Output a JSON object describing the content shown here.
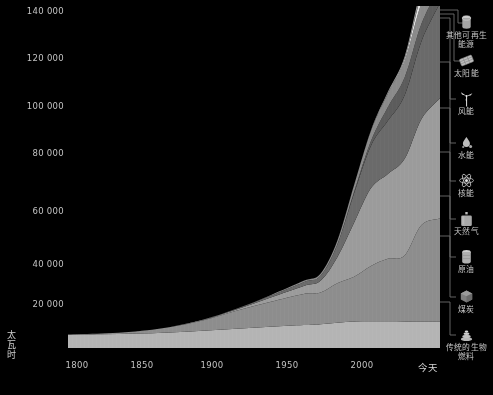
{
  "chart_data": {
    "type": "area",
    "title": "",
    "xlabel": "",
    "ylabel": "太瓦时",
    "ylim": [
      0,
      145000
    ],
    "xlim": [
      1800,
      2021
    ],
    "grid": false,
    "legend_position": "right",
    "ytick_labels": [
      "140 000",
      "120 000",
      "100 000",
      "80 000",
      "60 000",
      "40 000",
      "20 000"
    ],
    "ytick_values": [
      140000,
      120000,
      100000,
      80000,
      60000,
      40000,
      20000
    ],
    "xtick_labels": [
      "1800",
      "1850",
      "1900",
      "1950",
      "2000",
      "今天"
    ],
    "xtick_values": [
      1800,
      1850,
      1900,
      1950,
      2000,
      2021
    ],
    "x": [
      1800,
      1820,
      1840,
      1860,
      1880,
      1900,
      1920,
      1940,
      1950,
      1960,
      1970,
      1980,
      1990,
      2000,
      2010,
      2021
    ],
    "series": [
      {
        "name": "传统的生物燃料",
        "color": "#b4b4b4",
        "values": [
          5600,
          5800,
          6100,
          6600,
          7300,
          8200,
          9000,
          9700,
          10100,
          10700,
          11200,
          11300,
          11300,
          11200,
          11100,
          11100
        ]
      },
      {
        "name": "煤炭",
        "color": "#8d8d8d",
        "values": [
          100,
          300,
          900,
          2200,
          4400,
          7600,
          10500,
          13200,
          13400,
          16800,
          19000,
          23500,
          26500,
          28000,
          41000,
          43800
        ]
      },
      {
        "name": "原油",
        "color": "#9b9b9b",
        "values": [
          0,
          0,
          0,
          30,
          180,
          570,
          1800,
          3400,
          5000,
          11000,
          23000,
          33000,
          36000,
          41000,
          45000,
          51000
        ]
      },
      {
        "name": "天然气",
        "color": "#6a6a6a",
        "values": [
          0,
          0,
          0,
          0,
          40,
          180,
          700,
          1600,
          2100,
          5300,
          12500,
          18000,
          22500,
          27000,
          33000,
          40400
        ]
      },
      {
        "name": "核能",
        "color": "#5c5c5c",
        "values": [
          0,
          0,
          0,
          0,
          0,
          0,
          0,
          0,
          0,
          60,
          640,
          2000,
          5800,
          7500,
          7400,
          7030
        ]
      },
      {
        "name": "水能",
        "color": "#8a8a8a",
        "values": [
          0,
          0,
          0,
          0,
          10,
          60,
          300,
          600,
          900,
          1600,
          2800,
          4300,
          5700,
          7000,
          8800,
          10500
        ]
      },
      {
        "name": "风能",
        "color": "#e2e2e2",
        "values": [
          0,
          0,
          0,
          0,
          0,
          0,
          0,
          0,
          0,
          0,
          0,
          10,
          90,
          800,
          3500,
          4300
        ]
      },
      {
        "name": "太阳能",
        "color": "#d0d0d0",
        "values": [
          0,
          0,
          0,
          0,
          0,
          0,
          0,
          0,
          0,
          0,
          0,
          0,
          10,
          30,
          800,
          2900
        ]
      },
      {
        "name": "其他可再生能源",
        "color": "#9e9e9e",
        "values": [
          0,
          0,
          0,
          0,
          0,
          0,
          0,
          0,
          0,
          20,
          80,
          250,
          600,
          1100,
          2300,
          3100
        ]
      }
    ]
  },
  "axis": {
    "y_title_chars": [
      "太",
      "瓦",
      "时"
    ]
  },
  "legend": {
    "items": [
      {
        "label": "其他可再生\n能源",
        "icon": "cylinder-icon",
        "top": 14
      },
      {
        "label": "太阳能",
        "icon": "solar-panel-icon",
        "top": 52
      },
      {
        "label": "风能",
        "icon": "wind-turbine-icon",
        "top": 90
      },
      {
        "label": "水能",
        "icon": "water-drop-icon",
        "top": 134
      },
      {
        "label": "核能",
        "icon": "atom-icon",
        "top": 172
      },
      {
        "label": "天然气",
        "icon": "gas-canister-icon",
        "top": 210
      },
      {
        "label": "原油",
        "icon": "oil-barrel-icon",
        "top": 248
      },
      {
        "label": "煤炭",
        "icon": "coal-cube-icon",
        "top": 288
      },
      {
        "label": "传统的生物\n燃料",
        "icon": "biofuel-pile-icon",
        "top": 326
      }
    ]
  }
}
